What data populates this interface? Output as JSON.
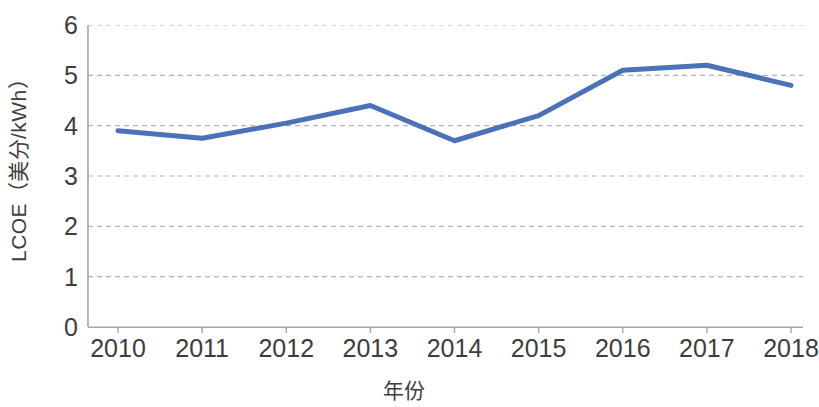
{
  "chart_data": {
    "type": "line",
    "title": "",
    "xlabel": "年份",
    "ylabel": "LCOE（美分/kWh）",
    "categories": [
      "2010",
      "2011",
      "2012",
      "2013",
      "2014",
      "2015",
      "2016",
      "2017",
      "2018"
    ],
    "values": [
      3.9,
      3.75,
      4.05,
      4.4,
      3.7,
      4.2,
      5.1,
      5.2,
      4.8
    ],
    "series": [
      {
        "name": "LCOE",
        "values": [
          3.9,
          3.75,
          4.05,
          4.4,
          3.7,
          4.2,
          5.1,
          5.2,
          4.8
        ]
      }
    ],
    "ylim": [
      0,
      6
    ],
    "y_ticks": [
      0,
      1,
      2,
      3,
      4,
      5,
      6
    ],
    "y_tick_labels": [
      "0",
      "1",
      "2",
      "3",
      "4",
      "5",
      "6"
    ],
    "x_tick_labels": [
      "2010",
      "2011",
      "2012",
      "2013",
      "2014",
      "2015",
      "2016",
      "2017",
      "2018"
    ],
    "grid": "horizontal-dashed",
    "legend": "none",
    "line_color": "#4a72b8",
    "line_width": 5,
    "axis_color": "#a6a6a6",
    "grid_color": "#b3b3b3",
    "text_color": "#3d3d3d",
    "background_color": "#ffffff"
  }
}
